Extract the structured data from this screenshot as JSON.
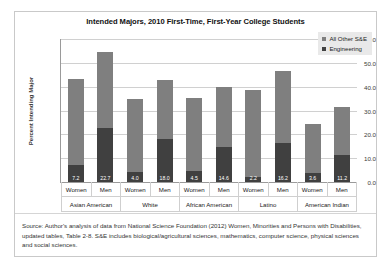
{
  "chart_data": {
    "type": "bar",
    "stacked": true,
    "title": "Intended Majors, 2010 First-Time, First-Year College Students",
    "xlabel": "",
    "ylabel": "Percent Intending Major",
    "ylim": [
      0.0,
      60.0
    ],
    "ytick_step": 10.0,
    "ytick_labels": [
      "60.0",
      "50.0",
      "40.0",
      "30.0",
      "20.0",
      "10.0",
      "0.0"
    ],
    "grid": true,
    "legend_position": "top-right",
    "legend": [
      "All Other S&E",
      "Engineering"
    ],
    "colors": {
      "all_other_se": "#7f7f7f",
      "engineering": "#404040",
      "gridline": "#d0d0d0",
      "axis": "#9a9a9a",
      "legend_background": "#e9e9e9",
      "data_label_text": "#ffffff"
    },
    "groups": [
      "Asian American",
      "White",
      "African American",
      "Latino",
      "American Indian"
    ],
    "categories": [
      "Women",
      "Men",
      "Women",
      "Men",
      "Women",
      "Men",
      "Women",
      "Men",
      "Women",
      "Men"
    ],
    "series": [
      {
        "name": "Engineering",
        "values": [
          7.2,
          22.7,
          4.0,
          18.0,
          4.5,
          14.6,
          2.2,
          16.2,
          3.6,
          11.2
        ],
        "labels": [
          "7.2",
          "22.7",
          "4.0",
          "18.0",
          "4.5",
          "14.6",
          "2.2",
          "16.2",
          "3.6",
          "11.2"
        ]
      },
      {
        "name": "All Other S&E",
        "values": [
          36.1,
          31.8,
          31.0,
          25.0,
          30.9,
          25.1,
          36.3,
          30.3,
          20.9,
          20.3
        ]
      }
    ],
    "totals": [
      43.3,
      54.5,
      35.0,
      43.0,
      35.4,
      39.7,
      38.5,
      46.5,
      24.5,
      31.5
    ]
  },
  "source_note": "Source: Author's analysis of data from National Science Foundation (2012) Women, Minorities and Persons with Disabilities, updated tables, Table 2-8.  S&E includes biological/agricultural sciences, mathematics, computer science, physical sciences and social sciences."
}
